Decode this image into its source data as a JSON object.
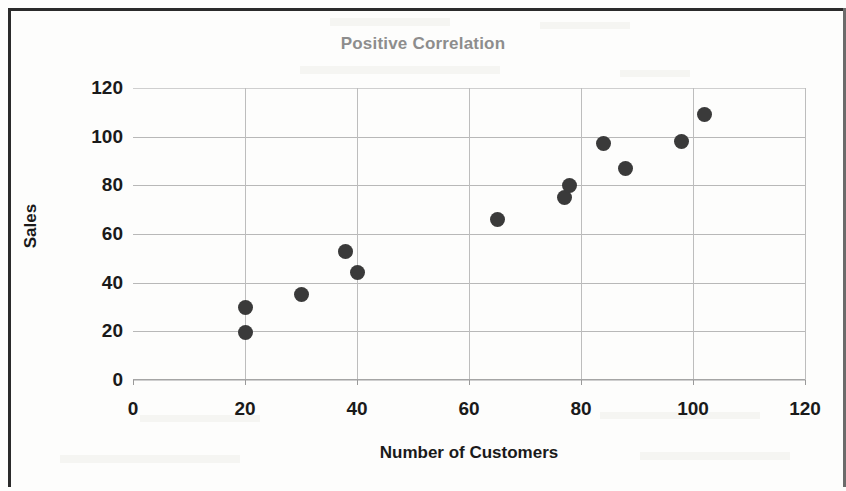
{
  "chart_data": {
    "type": "scatter",
    "title": "Positive Correlation",
    "xlabel": "Number of Customers",
    "ylabel": "Sales",
    "xlim": [
      0,
      120
    ],
    "ylim": [
      0,
      120
    ],
    "xticks": [
      "0",
      "20",
      "40",
      "60",
      "80",
      "100",
      "120"
    ],
    "yticks": [
      "0",
      "20",
      "40",
      "60",
      "80",
      "100",
      "120"
    ],
    "xtick_values": [
      0,
      20,
      40,
      60,
      80,
      100,
      120
    ],
    "ytick_values": [
      0,
      20,
      40,
      60,
      80,
      100,
      120
    ],
    "grid": "both",
    "legend": null,
    "marker_color": "#3a3a3a",
    "title_color": "#8d8d8d",
    "points": [
      {
        "x": 20,
        "y": 30
      },
      {
        "x": 20,
        "y": 19.5
      },
      {
        "x": 30,
        "y": 35
      },
      {
        "x": 38,
        "y": 53
      },
      {
        "x": 40,
        "y": 44
      },
      {
        "x": 65,
        "y": 66
      },
      {
        "x": 77,
        "y": 75
      },
      {
        "x": 78,
        "y": 80
      },
      {
        "x": 84,
        "y": 97
      },
      {
        "x": 88,
        "y": 87
      },
      {
        "x": 98,
        "y": 98
      },
      {
        "x": 102,
        "y": 109
      }
    ]
  }
}
